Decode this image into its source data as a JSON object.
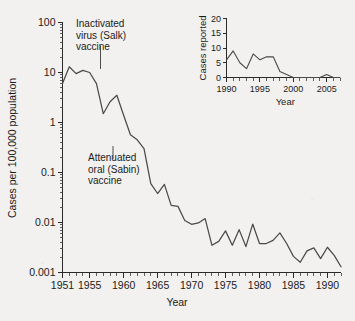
{
  "figure": {
    "background_color": "#f2f1ef",
    "ink_color": "#4a4a4a"
  },
  "chart_data": [
    {
      "id": "main",
      "type": "line",
      "title": "",
      "xlabel": "Year",
      "ylabel": "Cases per 100,000 population",
      "yscale": "log",
      "xlim": [
        1951,
        1992
      ],
      "ylim": [
        0.001,
        100
      ],
      "grid": false,
      "legend": null,
      "xticks": [
        1951,
        1955,
        1960,
        1965,
        1970,
        1975,
        1980,
        1985,
        1990
      ],
      "xtick_labels": [
        "1951",
        "1955",
        "1960",
        "1965",
        "1970",
        "1975",
        "1980",
        "1985",
        "1990"
      ],
      "yticks": [
        0.001,
        0.01,
        0.1,
        1,
        10,
        100
      ],
      "ytick_labels": [
        "0.001",
        "0.01",
        "0.1",
        "1",
        "10",
        "100"
      ],
      "x": [
        1951,
        1952,
        1953,
        1954,
        1955,
        1956,
        1957,
        1958,
        1959,
        1960,
        1961,
        1962,
        1963,
        1964,
        1965,
        1966,
        1967,
        1968,
        1969,
        1970,
        1971,
        1972,
        1973,
        1974,
        1975,
        1976,
        1977,
        1978,
        1979,
        1980,
        1981,
        1982,
        1983,
        1984,
        1985,
        1986,
        1987,
        1988,
        1989,
        1990,
        1991,
        1992
      ],
      "values": [
        6.0,
        13.0,
        9.5,
        11.0,
        10.0,
        6.0,
        1.5,
        2.6,
        3.5,
        1.4,
        0.57,
        0.45,
        0.3,
        0.06,
        0.038,
        0.058,
        0.022,
        0.021,
        0.011,
        0.0092,
        0.0098,
        0.012,
        0.0035,
        0.0042,
        0.0068,
        0.0035,
        0.0072,
        0.0033,
        0.0093,
        0.0038,
        0.0038,
        0.0044,
        0.0062,
        0.0038,
        0.0021,
        0.0016,
        0.0027,
        0.0031,
        0.0019,
        0.0032,
        0.0022,
        0.0013
      ],
      "annotations": [
        {
          "name": "salk-vaccine",
          "text_lines": [
            "Inactivated",
            "virus (Salk)",
            "vaccine"
          ],
          "points_to_year": 1955,
          "points_to_value": 10
        },
        {
          "name": "sabin-vaccine",
          "text_lines": [
            "Attenuated",
            "oral (Sabin)",
            "vaccine"
          ],
          "points_to_year": 1961,
          "points_to_value": 0.57
        }
      ]
    },
    {
      "id": "inset",
      "type": "line",
      "title": "",
      "xlabel": "Year",
      "ylabel": "Cases reported",
      "yscale": "linear",
      "xlim": [
        1990,
        2007
      ],
      "ylim": [
        0,
        20
      ],
      "grid": false,
      "legend": null,
      "xticks": [
        1990,
        1995,
        2000,
        2005
      ],
      "xtick_labels": [
        "1990",
        "1995",
        "2000",
        "2005"
      ],
      "yticks": [
        0,
        5,
        10,
        15,
        20
      ],
      "ytick_labels": [
        "0",
        "5",
        "10",
        "15",
        "20"
      ],
      "x": [
        1990,
        1991,
        1992,
        1993,
        1994,
        1995,
        1996,
        1997,
        1998,
        1999,
        2000,
        2001,
        2002,
        2003,
        2004,
        2005,
        2006,
        2007
      ],
      "values": [
        6,
        9,
        5,
        3,
        8,
        6,
        7,
        7,
        2,
        1,
        0,
        0,
        0,
        0,
        0,
        1,
        0,
        0
      ]
    }
  ]
}
